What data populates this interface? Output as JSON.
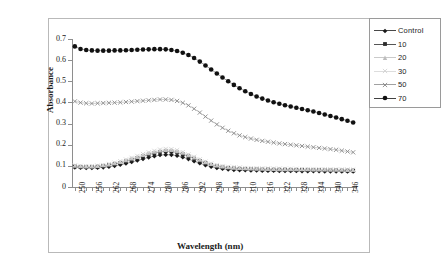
{
  "chart_data": {
    "type": "scatter",
    "title": "",
    "xlabel": "Wavelength (nm)",
    "ylabel": "Absorbance",
    "xlim": [
      249,
      349
    ],
    "ylim": [
      0,
      0.7
    ],
    "y_ticks": [
      "0",
      "0.1",
      "0.2",
      "0.3",
      "0.4",
      "0.5",
      "0.6",
      "0.7"
    ],
    "y_tick_values": [
      0,
      0.1,
      0.2,
      0.3,
      0.4,
      0.5,
      0.6,
      0.7
    ],
    "x_tick_labels": [
      "250",
      "256",
      "262",
      "268",
      "274",
      "280",
      "286",
      "292",
      "298",
      "304",
      "310",
      "316",
      "322",
      "328",
      "334",
      "340",
      "346"
    ],
    "x_tick_values": [
      250,
      256,
      262,
      268,
      274,
      280,
      286,
      292,
      298,
      304,
      310,
      316,
      322,
      328,
      334,
      340,
      346
    ],
    "x_minor_step": 2,
    "grid": false,
    "legend_position": "right-outside",
    "x": [
      250,
      252,
      254,
      256,
      258,
      260,
      262,
      264,
      266,
      268,
      270,
      272,
      274,
      276,
      278,
      280,
      282,
      284,
      286,
      288,
      290,
      292,
      294,
      296,
      298,
      300,
      302,
      304,
      306,
      308,
      310,
      312,
      314,
      316,
      318,
      320,
      322,
      324,
      326,
      328,
      330,
      332,
      334,
      336,
      338,
      340,
      342,
      344,
      346,
      348
    ],
    "series": [
      {
        "name": "Control",
        "marker": "diamond",
        "color": "#1a1a1a",
        "values": [
          0.093,
          0.091,
          0.09,
          0.09,
          0.091,
          0.093,
          0.096,
          0.1,
          0.105,
          0.111,
          0.118,
          0.125,
          0.133,
          0.14,
          0.146,
          0.151,
          0.153,
          0.152,
          0.148,
          0.141,
          0.132,
          0.122,
          0.112,
          0.103,
          0.096,
          0.09,
          0.086,
          0.083,
          0.081,
          0.08,
          0.079,
          0.078,
          0.078,
          0.077,
          0.077,
          0.077,
          0.076,
          0.076,
          0.076,
          0.076,
          0.075,
          0.075,
          0.075,
          0.075,
          0.074,
          0.074,
          0.074,
          0.074,
          0.073,
          0.073
        ]
      },
      {
        "name": "10",
        "marker": "square",
        "color": "#2b2b2b",
        "values": [
          0.097,
          0.095,
          0.094,
          0.094,
          0.096,
          0.099,
          0.103,
          0.108,
          0.114,
          0.121,
          0.129,
          0.137,
          0.145,
          0.153,
          0.16,
          0.166,
          0.169,
          0.168,
          0.163,
          0.155,
          0.145,
          0.134,
          0.123,
          0.113,
          0.104,
          0.098,
          0.093,
          0.09,
          0.088,
          0.086,
          0.085,
          0.084,
          0.084,
          0.083,
          0.083,
          0.082,
          0.082,
          0.082,
          0.081,
          0.081,
          0.081,
          0.08,
          0.08,
          0.08,
          0.079,
          0.079,
          0.079,
          0.078,
          0.078,
          0.078
        ]
      },
      {
        "name": "20",
        "marker": "triangle",
        "color": "#bdbdbd",
        "values": [
          0.1,
          0.098,
          0.097,
          0.097,
          0.099,
          0.102,
          0.106,
          0.112,
          0.118,
          0.126,
          0.134,
          0.142,
          0.151,
          0.159,
          0.166,
          0.172,
          0.175,
          0.174,
          0.169,
          0.161,
          0.15,
          0.139,
          0.128,
          0.117,
          0.108,
          0.101,
          0.096,
          0.093,
          0.091,
          0.089,
          0.088,
          0.087,
          0.086,
          0.086,
          0.085,
          0.085,
          0.084,
          0.084,
          0.084,
          0.083,
          0.083,
          0.083,
          0.082,
          0.082,
          0.082,
          0.081,
          0.081,
          0.081,
          0.08,
          0.08
        ]
      },
      {
        "name": "30",
        "marker": "x-cross",
        "color": "#d4d4d4",
        "values": [
          0.102,
          0.1,
          0.099,
          0.099,
          0.101,
          0.104,
          0.109,
          0.115,
          0.122,
          0.13,
          0.138,
          0.147,
          0.156,
          0.164,
          0.171,
          0.177,
          0.18,
          0.179,
          0.174,
          0.165,
          0.154,
          0.143,
          0.131,
          0.12,
          0.111,
          0.104,
          0.099,
          0.096,
          0.093,
          0.092,
          0.09,
          0.089,
          0.089,
          0.088,
          0.088,
          0.087,
          0.087,
          0.086,
          0.086,
          0.086,
          0.085,
          0.085,
          0.085,
          0.084,
          0.084,
          0.084,
          0.083,
          0.083,
          0.083,
          0.082
        ]
      },
      {
        "name": "50",
        "marker": "x-cross",
        "color": "#8a8a8a",
        "values": [
          0.405,
          0.399,
          0.396,
          0.395,
          0.396,
          0.397,
          0.398,
          0.399,
          0.4,
          0.402,
          0.404,
          0.406,
          0.408,
          0.41,
          0.412,
          0.414,
          0.414,
          0.412,
          0.407,
          0.398,
          0.386,
          0.37,
          0.352,
          0.333,
          0.314,
          0.296,
          0.28,
          0.266,
          0.254,
          0.244,
          0.236,
          0.229,
          0.223,
          0.218,
          0.214,
          0.21,
          0.206,
          0.203,
          0.2,
          0.197,
          0.194,
          0.191,
          0.188,
          0.185,
          0.182,
          0.179,
          0.176,
          0.172,
          0.168,
          0.164
        ]
      },
      {
        "name": "70",
        "marker": "circle",
        "color": "#111111",
        "values": [
          0.665,
          0.653,
          0.648,
          0.646,
          0.645,
          0.645,
          0.645,
          0.646,
          0.646,
          0.647,
          0.648,
          0.649,
          0.65,
          0.651,
          0.652,
          0.652,
          0.651,
          0.648,
          0.643,
          0.635,
          0.624,
          0.61,
          0.593,
          0.575,
          0.556,
          0.537,
          0.518,
          0.5,
          0.483,
          0.467,
          0.453,
          0.44,
          0.428,
          0.418,
          0.409,
          0.401,
          0.394,
          0.387,
          0.381,
          0.375,
          0.369,
          0.363,
          0.357,
          0.35,
          0.343,
          0.336,
          0.329,
          0.321,
          0.313,
          0.305
        ]
      }
    ]
  },
  "legend": {
    "items": [
      {
        "label": "Control"
      },
      {
        "label": "10"
      },
      {
        "label": "20"
      },
      {
        "label": "30"
      },
      {
        "label": "50"
      },
      {
        "label": "70"
      }
    ]
  }
}
